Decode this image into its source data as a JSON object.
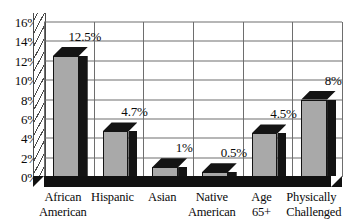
{
  "chart_data": {
    "type": "bar",
    "title": "",
    "subtitle": "",
    "xlabel": "",
    "ylabel": "",
    "ylim": [
      0,
      16
    ],
    "grid": true,
    "legend": false,
    "style": "3d-grayscale",
    "categories": [
      "African American",
      "Hispanic",
      "Asian",
      "Native American",
      "Age 65+",
      "Physically Challenged"
    ],
    "category_lines": [
      [
        "African",
        "American"
      ],
      [
        "Hispanic",
        ""
      ],
      [
        "Asian",
        ""
      ],
      [
        "Native",
        "American"
      ],
      [
        "Age",
        "65+"
      ],
      [
        "Physically",
        "Challenged"
      ]
    ],
    "values": [
      12.5,
      4.7,
      1,
      0.5,
      4.5,
      8
    ],
    "data_labels": [
      "12.5%",
      "4.7%",
      "1%",
      "0.5%",
      "4.5%",
      "8%"
    ],
    "yticks": [
      0,
      2,
      4,
      6,
      8,
      10,
      12,
      14,
      16
    ],
    "ytick_labels": [
      "0%",
      "2%",
      "4%",
      "6%",
      "8%",
      "10%",
      "12%",
      "14%",
      "16%"
    ],
    "colors": {
      "bar_front": "#a9a9a9",
      "bar_top": "#141414",
      "bar_side": "#141414",
      "gridline": "#6e6e6e",
      "floor": "#111111",
      "background": "#ffffff",
      "text": "#0a0a0a"
    }
  }
}
